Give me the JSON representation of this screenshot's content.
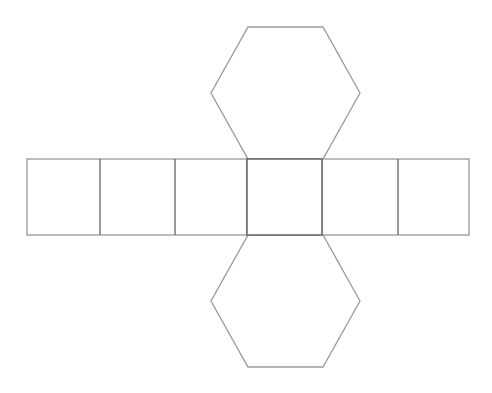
{
  "diagram": {
    "stroke_color": "#9a9a9a",
    "divider_color": "#6f6f6f",
    "background": "#ffffff",
    "rect_strip": {
      "x": 27,
      "y": 159,
      "width": 442,
      "height": 76,
      "faces": 6,
      "divider_xs": [
        100,
        175,
        247,
        322,
        398
      ]
    },
    "center_square": {
      "x": 247,
      "y": 159,
      "width": 75,
      "height": 76
    },
    "hexagons": [
      {
        "name": "top-hexagon",
        "points": "248,27 323,27 360,93 323,159 248,159 211,93"
      },
      {
        "name": "bottom-hexagon",
        "points": "248,235 323,235 360,301 323,367 248,367 211,301"
      }
    ]
  }
}
